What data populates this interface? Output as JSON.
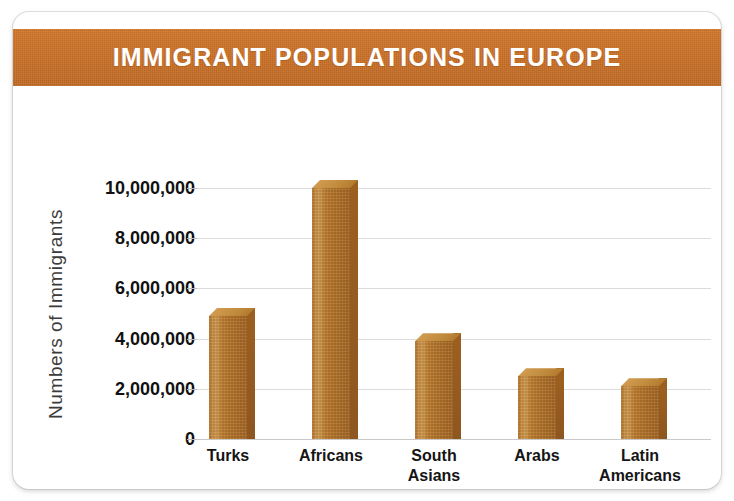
{
  "card": {
    "title": "IMMIGRANT POPULATIONS IN EUROPE",
    "title_band_color": "#c86f26",
    "bar_color": "#b4742a",
    "bar_highlight_color": "#cf9a4e",
    "bar_shadow_color": "#8e5620",
    "grid_color": "#dcdcdc",
    "background_color": "#ffffff"
  },
  "chart_data": {
    "type": "bar",
    "title": "IMMIGRANT POPULATIONS IN EUROPE",
    "xlabel": "",
    "ylabel": "Numbers of Immigrants",
    "categories": [
      "Turks",
      "Africans",
      "South Asians",
      "Arabs",
      "Latin Americans"
    ],
    "category_lines": [
      [
        "Turks"
      ],
      [
        "Africans"
      ],
      [
        "South",
        "Asians"
      ],
      [
        "Arabs"
      ],
      [
        "Latin",
        "Americans"
      ]
    ],
    "values": [
      4900000,
      10000000,
      3900000,
      2500000,
      2100000
    ],
    "ylim": [
      0,
      10000000
    ],
    "yticks": [
      0,
      2000000,
      4000000,
      6000000,
      8000000,
      10000000
    ],
    "ytick_labels": [
      "0",
      "2,000,000",
      "4,000,000",
      "6,000,000",
      "8,000,000",
      "10,000,000"
    ],
    "grid": true,
    "legend": false,
    "style_3d": true
  }
}
